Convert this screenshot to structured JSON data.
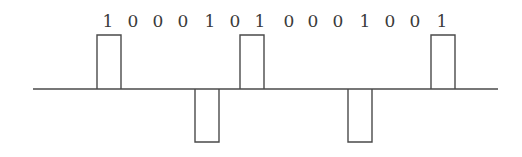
{
  "diagram": {
    "title": "",
    "encoding_hint": "AMI (alternate mark inversion) line code",
    "bits": [
      "1",
      "0",
      "0",
      "0",
      "1",
      "0",
      "1",
      "0",
      "0",
      "0",
      "1",
      "0",
      "0",
      "1"
    ],
    "bit_label_x": [
      108,
      133,
      158,
      183,
      210,
      235,
      260,
      289,
      313,
      338,
      365,
      390,
      415,
      442
    ],
    "label_baseline_y": 27,
    "baseline": {
      "y": 89,
      "x_start": 33,
      "x_end": 498
    },
    "pulses": [
      {
        "bit_index": 0,
        "polarity": "positive",
        "x_start": 97,
        "x_end": 121,
        "level_y": 35
      },
      {
        "bit_index": 4,
        "polarity": "negative",
        "x_start": 195,
        "x_end": 219,
        "level_y": 142
      },
      {
        "bit_index": 6,
        "polarity": "positive",
        "x_start": 240,
        "x_end": 264,
        "level_y": 35
      },
      {
        "bit_index": 10,
        "polarity": "negative",
        "x_start": 348,
        "x_end": 372,
        "level_y": 142
      },
      {
        "bit_index": 13,
        "polarity": "positive",
        "x_start": 431,
        "x_end": 455,
        "level_y": 35
      }
    ],
    "colors": {
      "line": "#4a4a4a",
      "text": "#3a3a3a",
      "background": "#ffffff"
    }
  }
}
